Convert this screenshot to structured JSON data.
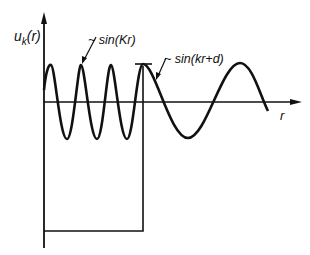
{
  "diagram": {
    "y_axis_label": "u",
    "y_axis_subscript": "k",
    "y_axis_arg": "(r)",
    "x_axis_label": "r",
    "inner_annotation": "~ sin(Kr)",
    "outer_annotation": "~ sin(kr+d)"
  }
}
